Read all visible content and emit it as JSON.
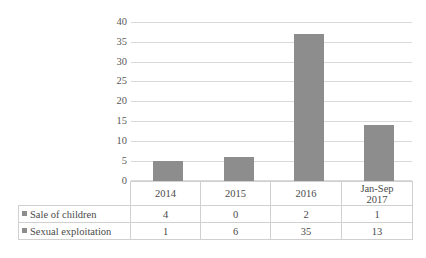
{
  "chart_data": {
    "type": "bar",
    "title": "",
    "subtitle": "",
    "xlabel": "",
    "ylabel": "",
    "ylim": [
      0,
      40
    ],
    "ytick_step": 5,
    "grid": true,
    "legend_position": "data-table",
    "stacked_total_plotted": true,
    "bar_color": "#8d8d8d",
    "gridline_color": "#d9d9d9",
    "categories": [
      "2014",
      "2015",
      "2016",
      "Jan-Sep 2017"
    ],
    "category_display": [
      {
        "line1": "2014",
        "line2": ""
      },
      {
        "line1": "2015",
        "line2": ""
      },
      {
        "line1": "2016",
        "line2": ""
      },
      {
        "line1": "Jan-Sep",
        "line2": "2017"
      }
    ],
    "ytick_labels": [
      "40",
      "35",
      "30",
      "25",
      "20",
      "15",
      "10",
      "5",
      "0"
    ],
    "ytick_values": [
      40,
      35,
      30,
      25,
      20,
      15,
      10,
      5,
      0
    ],
    "plotted_bar_values": [
      5,
      6,
      37,
      14
    ],
    "series": [
      {
        "name": "Sale of children",
        "values": [
          4,
          0,
          2,
          1
        ],
        "values_text": [
          "4",
          "0",
          "2",
          "1"
        ]
      },
      {
        "name": "Sexual exploitation",
        "values": [
          1,
          6,
          35,
          13
        ],
        "values_text": [
          "1",
          "6",
          "35",
          "13"
        ]
      }
    ]
  }
}
